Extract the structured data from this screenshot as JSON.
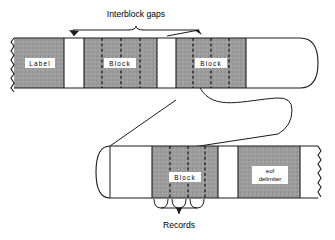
{
  "figure": {
    "annotations": {
      "interblock_gaps": "Interblock gaps",
      "records": "Records"
    },
    "colors": {
      "tape_fill": "#9a9a9a",
      "gap_fill": "#ffffff",
      "outline": "#1a1a1a",
      "background": "#ffffff",
      "text": "#000000",
      "box_fill": "#ffffff"
    }
  },
  "tape_top": {
    "name": "upper-tape-strip",
    "edge_left": "torn",
    "edge_right": "rounded",
    "segments": [
      {
        "kind": "data",
        "label": "Label",
        "records": 0
      },
      {
        "kind": "gap",
        "label": "",
        "records": 0
      },
      {
        "kind": "data",
        "label": "Block",
        "records": 4
      },
      {
        "kind": "gap",
        "label": "",
        "records": 0
      },
      {
        "kind": "data",
        "label": "Block",
        "records": 4
      },
      {
        "kind": "gap",
        "label": "",
        "records": 0
      }
    ]
  },
  "tape_bottom": {
    "name": "lower-tape-strip",
    "edge_left": "rounded",
    "edge_right": "torn",
    "segments": [
      {
        "kind": "gap",
        "label": "",
        "records": 0
      },
      {
        "kind": "data",
        "label": "Block",
        "records": 4
      },
      {
        "kind": "gap",
        "label": "",
        "records": 0
      },
      {
        "kind": "data",
        "label": "eof delimiter",
        "records": 0
      },
      {
        "kind": "gap",
        "label": "",
        "records": 0
      }
    ]
  },
  "boxes": {
    "label_top": "Label",
    "block_top_1": "Block",
    "block_top_2": "Block",
    "block_bottom": "Block",
    "eof_line1": "eof",
    "eof_line2": "delimiter"
  }
}
